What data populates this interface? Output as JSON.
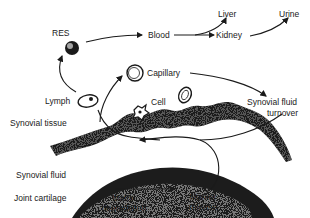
{
  "diagram": {
    "labels": {
      "res": "RES",
      "blood": "Blood",
      "liver": "Liver",
      "kidney": "Kidney",
      "urine": "Urine",
      "capillary": "Capillary",
      "lymph": "Lymph",
      "cell": "Cell",
      "synovial_tissue": "Synovial tissue",
      "synovial_fluid_turnover_1": "Synovial fluid",
      "synovial_fluid_turnover_2": "turnover",
      "synovial_fluid": "Synovial fluid",
      "joint_cartilage": "Joint cartilage",
      "matrix_degradation_1": "Matrix",
      "matrix_degradation_2": "degradation",
      "marker_release_1": "Marker",
      "marker_release_2": "release"
    },
    "flows": [
      {
        "from": "Matrix degradation",
        "to": "Marker release"
      },
      {
        "from": "Marker release",
        "to": "Synovial fluid"
      },
      {
        "from": "Synovial fluid",
        "to": "Lymph"
      },
      {
        "from": "Synovial fluid",
        "to": "Capillary"
      },
      {
        "from": "Lymph",
        "to": "RES"
      },
      {
        "from": "RES",
        "to": "Blood"
      },
      {
        "from": "Capillary",
        "to": "Synovial fluid turnover"
      },
      {
        "from": "Blood",
        "to": "Liver"
      },
      {
        "from": "Blood",
        "to": "Kidney"
      },
      {
        "from": "Kidney",
        "to": "Urine"
      }
    ]
  }
}
